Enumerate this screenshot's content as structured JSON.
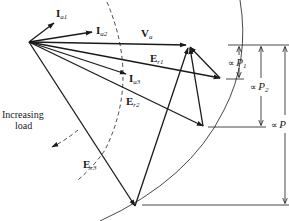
{
  "diagram": {
    "colors": {
      "line": "#1a1a1a",
      "background": "#ffffff"
    },
    "origin": [
      29,
      42
    ],
    "phasors": [
      {
        "id": "Ia1",
        "symbol": "I",
        "sub": "a1",
        "tip": [
          54,
          23
        ]
      },
      {
        "id": "Ia2",
        "symbol": "I",
        "sub": "a2",
        "tip": [
          92,
          32
        ]
      },
      {
        "id": "Va",
        "symbol": "V",
        "sub": "a",
        "tip": [
          188,
          45
        ]
      },
      {
        "id": "Er1",
        "symbol": "E",
        "sub": "r1",
        "tip": [
          220,
          78
        ]
      },
      {
        "id": "Ia3",
        "symbol": "I",
        "sub": "a3",
        "tip": [
          126,
          74
        ]
      },
      {
        "id": "Er2",
        "symbol": "E",
        "sub": "r2",
        "tip": [
          203,
          126
        ]
      },
      {
        "id": "Er3",
        "symbol": "E",
        "sub": "r3",
        "tip": [
          135,
          206
        ]
      }
    ],
    "labels": {
      "Ia1": {
        "main": "I",
        "sub": "a1"
      },
      "Ia2": {
        "main": "I",
        "sub": "a2"
      },
      "Va": {
        "main": "V",
        "sub": "a"
      },
      "Er1": {
        "main": "E",
        "sub": "r1"
      },
      "Ia3": {
        "main": "I",
        "sub": "a3"
      },
      "Er2": {
        "main": "E",
        "sub": "r2"
      },
      "Er3": {
        "main": "E",
        "sub": "r3"
      }
    },
    "annotation": {
      "line1": "Increasing",
      "line2": "load"
    },
    "dimensions": {
      "P1": {
        "prefix": "∝ ",
        "symbol": "P",
        "sub": "1"
      },
      "P2": {
        "prefix": "∝ ",
        "symbol": "P",
        "sub": "2"
      },
      "P": {
        "prefix": "∝ ",
        "symbol": "P",
        "sub": ""
      }
    },
    "locus_arc": "outer circular locus of E_r tips",
    "current_arc": "dashed locus of I_a tips"
  }
}
